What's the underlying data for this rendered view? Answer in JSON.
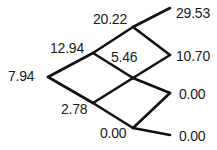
{
  "diagram": {
    "type": "binomial-lattice",
    "title": "",
    "stroke_color": "#111111",
    "text_color": "#1a1a1a",
    "background_color": "#ffffff",
    "nodes": [
      {
        "id": "root",
        "label": "7.94",
        "step": 0,
        "level": 0,
        "x": 48,
        "y": 77
      },
      {
        "id": "u",
        "label": "12.94",
        "step": 1,
        "level": 1,
        "x": 93,
        "y": 53
      },
      {
        "id": "d",
        "label": "2.78",
        "step": 1,
        "level": 0,
        "x": 93,
        "y": 103
      },
      {
        "id": "uu",
        "label": "20.22",
        "step": 2,
        "level": 2,
        "x": 133,
        "y": 27
      },
      {
        "id": "ud",
        "label": "5.46",
        "step": 2,
        "level": 1,
        "x": 133,
        "y": 78
      },
      {
        "id": "dd",
        "label": "0.00",
        "step": 2,
        "level": 0,
        "x": 133,
        "y": 128
      },
      {
        "id": "t0",
        "label": "29.53",
        "step": 3,
        "level": 3,
        "x": 170,
        "y": 8
      },
      {
        "id": "t1",
        "label": "10.70",
        "step": 3,
        "level": 2,
        "x": 170,
        "y": 55
      },
      {
        "id": "t2",
        "label": "0.00",
        "step": 3,
        "level": 1,
        "x": 170,
        "y": 93
      },
      {
        "id": "t3",
        "label": "0.00",
        "step": 3,
        "level": 0,
        "x": 170,
        "y": 135
      }
    ],
    "edges": [
      {
        "from": "root",
        "to": "u"
      },
      {
        "from": "root",
        "to": "d"
      },
      {
        "from": "u",
        "to": "uu"
      },
      {
        "from": "u",
        "to": "ud"
      },
      {
        "from": "d",
        "to": "ud"
      },
      {
        "from": "d",
        "to": "dd"
      },
      {
        "from": "uu",
        "to": "t0"
      },
      {
        "from": "uu",
        "to": "t1"
      },
      {
        "from": "ud",
        "to": "t1"
      },
      {
        "from": "ud",
        "to": "t2"
      },
      {
        "from": "dd",
        "to": "t2"
      },
      {
        "from": "dd",
        "to": "t3"
      }
    ]
  }
}
